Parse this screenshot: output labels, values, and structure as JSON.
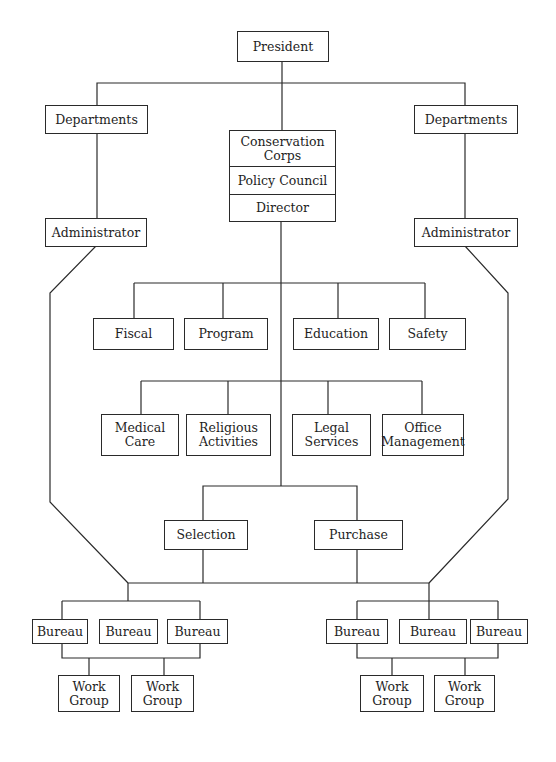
{
  "chart": {
    "top": {
      "president": "President"
    },
    "left_branch": {
      "departments": "Departments",
      "administrator": "Administrator"
    },
    "right_branch": {
      "departments": "Departments",
      "administrator": "Administrator"
    },
    "center_stack": [
      {
        "label": "Conservation\nCorps"
      },
      {
        "label": "Policy Council"
      },
      {
        "label": "Director"
      }
    ],
    "staff_row_1": [
      "Fiscal",
      "Program",
      "Education",
      "Safety"
    ],
    "staff_row_2": [
      "Medical\nCare",
      "Religious\nActivities",
      "Legal\nServices",
      "Office\nManagement"
    ],
    "operations": [
      "Selection",
      "Purchase"
    ],
    "left_group": {
      "bureaus": [
        "Bureau",
        "Bureau",
        "Bureau"
      ],
      "work_groups": [
        "Work\nGroup",
        "Work\nGroup"
      ]
    },
    "right_group": {
      "bureaus": [
        "Bureau",
        "Bureau",
        "Bureau"
      ],
      "work_groups": [
        "Work\nGroup",
        "Work\nGroup"
      ]
    }
  }
}
